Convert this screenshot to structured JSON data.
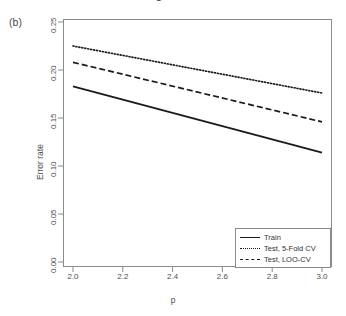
{
  "figure": {
    "panel_label": "(b)",
    "cropped_title": "Training & Test Error",
    "background": "#ffffff",
    "line_color": "#1a1a1a",
    "axis_color": "#8a8a8a"
  },
  "legend": {
    "position": "bottom-right",
    "entries": [
      {
        "label": "Train",
        "style": "solid",
        "icon": "solid-line-icon"
      },
      {
        "label": "Test, 5-Fold CV",
        "style": "dotted",
        "icon": "dotted-line-icon"
      },
      {
        "label": "Test, LOO-CV",
        "style": "dashed",
        "icon": "dashed-line-icon"
      }
    ]
  },
  "chart_data": {
    "type": "line",
    "title": "",
    "xlabel": "p",
    "ylabel": "Error rate",
    "xlim": [
      2.0,
      3.0
    ],
    "ylim": [
      0.0,
      0.25
    ],
    "xticks": [
      2.0,
      2.2,
      2.4,
      2.6,
      2.8,
      3.0
    ],
    "xtick_labels": [
      "2.0",
      "2.2",
      "2.4",
      "2.6",
      "2.8",
      "3.0"
    ],
    "yticks": [
      0.0,
      0.05,
      0.1,
      0.15,
      0.2,
      0.25
    ],
    "ytick_labels": [
      "0.00",
      "0.05",
      "0.10",
      "0.15",
      "0.20",
      "0.25"
    ],
    "grid": false,
    "x": [
      2.0,
      3.0
    ],
    "series": [
      {
        "name": "Train",
        "style": "solid",
        "values": [
          0.183,
          0.114
        ]
      },
      {
        "name": "Test, 5-Fold CV",
        "style": "dotted",
        "values": [
          0.225,
          0.176
        ]
      },
      {
        "name": "Test, LOO-CV",
        "style": "dashed",
        "values": [
          0.208,
          0.146
        ]
      }
    ]
  }
}
